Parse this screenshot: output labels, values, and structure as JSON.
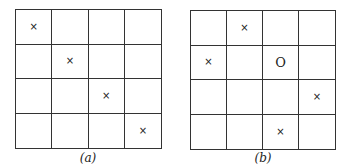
{
  "panels": [
    {
      "id": "a",
      "caption": "(a)",
      "rows": 4,
      "cols": 4,
      "cells": [
        [
          "×",
          "",
          "",
          ""
        ],
        [
          "",
          "×",
          "",
          ""
        ],
        [
          "",
          "",
          "×",
          ""
        ],
        [
          "",
          "",
          "",
          "×"
        ]
      ]
    },
    {
      "id": "b",
      "caption": "(b)",
      "rows": 4,
      "cols": 4,
      "cells": [
        [
          "",
          "×",
          "",
          ""
        ],
        [
          "×",
          "",
          "O",
          ""
        ],
        [
          "",
          "",
          "",
          "×"
        ],
        [
          "",
          "",
          "×",
          ""
        ]
      ]
    }
  ],
  "legend": {
    "x_mark": "×",
    "o_mark": "O"
  }
}
